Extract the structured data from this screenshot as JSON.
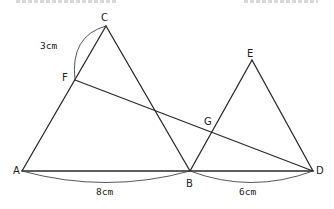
{
  "figure": {
    "points": {
      "A": {
        "label": "A",
        "x": 22,
        "y": 171,
        "lx": 17,
        "ly": 172
      },
      "B": {
        "label": "B",
        "x": 190,
        "y": 171,
        "lx": 190,
        "ly": 186
      },
      "C": {
        "label": "C",
        "x": 106,
        "y": 26,
        "lx": 105,
        "ly": 20
      },
      "D": {
        "label": "D",
        "x": 313,
        "y": 171,
        "lx": 320,
        "ly": 172
      },
      "E": {
        "label": "E",
        "x": 252,
        "y": 60,
        "lx": 251,
        "ly": 56
      },
      "F": {
        "label": "F",
        "x": 75,
        "y": 80,
        "lx": 65,
        "ly": 80
      },
      "G": {
        "label": "G",
        "x": 213,
        "y": 129,
        "lx": 208,
        "ly": 124
      }
    },
    "segments": [
      [
        "A",
        "C"
      ],
      [
        "C",
        "B"
      ],
      [
        "A",
        "B"
      ],
      [
        "B",
        "D"
      ],
      [
        "B",
        "E"
      ],
      [
        "E",
        "D"
      ],
      [
        "F",
        "D"
      ]
    ],
    "measurements": {
      "CF": "3cm",
      "AB": "8cm",
      "BD": "6cm"
    }
  }
}
